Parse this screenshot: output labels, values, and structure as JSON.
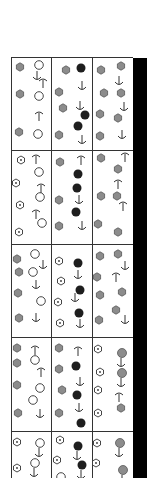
{
  "figure": {
    "grid": {
      "left": 11,
      "top": 57,
      "right": 133,
      "bottom": 478,
      "col_x": [
        51,
        92
      ],
      "row_y": [
        149,
        243,
        336,
        430
      ]
    },
    "colors": {
      "gray_fill": "#8c8c8c",
      "black_fill": "#1e1e1e",
      "stroke": "#333333",
      "bar": "#000000"
    },
    "legend_of_symbols": [
      "gray-hexagon",
      "white-circle",
      "black-circle",
      "dotted-hexagon",
      "anchor-up",
      "anchor-down",
      "anchor-diag"
    ],
    "symbols": [
      {
        "t": "hex",
        "x": 20,
        "y": 67
      },
      {
        "t": "circ",
        "x": 39,
        "y": 65
      },
      {
        "t": "dn",
        "x": 37,
        "y": 76
      },
      {
        "t": "up",
        "x": 43,
        "y": 83
      },
      {
        "t": "hex",
        "x": 20,
        "y": 94
      },
      {
        "t": "circ",
        "x": 39,
        "y": 96
      },
      {
        "t": "up",
        "x": 39,
        "y": 116
      },
      {
        "t": "hex",
        "x": 19,
        "y": 132
      },
      {
        "t": "circ",
        "x": 38,
        "y": 134
      },
      {
        "t": "hex",
        "x": 66,
        "y": 70
      },
      {
        "t": "blk",
        "x": 81,
        "y": 68
      },
      {
        "t": "dn",
        "x": 82,
        "y": 86
      },
      {
        "t": "hex",
        "x": 59,
        "y": 92
      },
      {
        "t": "dn",
        "x": 80,
        "y": 106
      },
      {
        "t": "hex",
        "x": 63,
        "y": 108
      },
      {
        "t": "blk",
        "x": 85,
        "y": 115
      },
      {
        "t": "blk",
        "x": 78,
        "y": 126
      },
      {
        "t": "hex",
        "x": 59,
        "y": 135
      },
      {
        "t": "dn",
        "x": 82,
        "y": 140
      },
      {
        "t": "hex",
        "x": 101,
        "y": 70
      },
      {
        "t": "hex",
        "x": 121,
        "y": 66
      },
      {
        "t": "dn",
        "x": 119,
        "y": 81
      },
      {
        "t": "hex",
        "x": 104,
        "y": 93
      },
      {
        "t": "hex",
        "x": 121,
        "y": 93
      },
      {
        "t": "dn",
        "x": 124,
        "y": 107
      },
      {
        "t": "hex",
        "x": 100,
        "y": 114
      },
      {
        "t": "hex",
        "x": 118,
        "y": 118
      },
      {
        "t": "dn",
        "x": 122,
        "y": 135
      },
      {
        "t": "hex",
        "x": 100,
        "y": 136
      },
      {
        "t": "dot",
        "x": 21,
        "y": 160
      },
      {
        "t": "up",
        "x": 36,
        "y": 159
      },
      {
        "t": "circ",
        "x": 39,
        "y": 172
      },
      {
        "t": "dot",
        "x": 16,
        "y": 183
      },
      {
        "t": "up",
        "x": 41,
        "y": 188
      },
      {
        "t": "circ",
        "x": 40,
        "y": 197
      },
      {
        "t": "dot",
        "x": 20,
        "y": 205
      },
      {
        "t": "up",
        "x": 36,
        "y": 214
      },
      {
        "t": "circ",
        "x": 42,
        "y": 223
      },
      {
        "t": "dot",
        "x": 19,
        "y": 232
      },
      {
        "t": "hex",
        "x": 60,
        "y": 162
      },
      {
        "t": "up",
        "x": 81,
        "y": 160
      },
      {
        "t": "blk",
        "x": 78,
        "y": 174
      },
      {
        "t": "blk",
        "x": 77,
        "y": 188
      },
      {
        "t": "hex",
        "x": 59,
        "y": 200
      },
      {
        "t": "dn",
        "x": 79,
        "y": 200
      },
      {
        "t": "blk",
        "x": 76,
        "y": 212
      },
      {
        "t": "hex",
        "x": 59,
        "y": 226
      },
      {
        "t": "dn",
        "x": 82,
        "y": 226
      },
      {
        "t": "hex",
        "x": 101,
        "y": 158
      },
      {
        "t": "up",
        "x": 125,
        "y": 157
      },
      {
        "t": "hex",
        "x": 118,
        "y": 169
      },
      {
        "t": "up",
        "x": 118,
        "y": 184
      },
      {
        "t": "hex",
        "x": 101,
        "y": 196
      },
      {
        "t": "hex",
        "x": 117,
        "y": 196
      },
      {
        "t": "up",
        "x": 123,
        "y": 206
      },
      {
        "t": "hex",
        "x": 98,
        "y": 224
      },
      {
        "t": "hex",
        "x": 118,
        "y": 232
      },
      {
        "t": "hex",
        "x": 17,
        "y": 259
      },
      {
        "t": "circ",
        "x": 35,
        "y": 254
      },
      {
        "t": "dn",
        "x": 43,
        "y": 265
      },
      {
        "t": "hex",
        "x": 19,
        "y": 272
      },
      {
        "t": "circ",
        "x": 33,
        "y": 272
      },
      {
        "t": "dn",
        "x": 36,
        "y": 285
      },
      {
        "t": "hex",
        "x": 18,
        "y": 293
      },
      {
        "t": "circ",
        "x": 41,
        "y": 301
      },
      {
        "t": "hex",
        "x": 19,
        "y": 318
      },
      {
        "t": "dn",
        "x": 36,
        "y": 318
      },
      {
        "t": "dot",
        "x": 59,
        "y": 261
      },
      {
        "t": "blk",
        "x": 78,
        "y": 263
      },
      {
        "t": "dn",
        "x": 78,
        "y": 275
      },
      {
        "t": "dot",
        "x": 61,
        "y": 281
      },
      {
        "t": "blk",
        "x": 80,
        "y": 290
      },
      {
        "t": "dn",
        "x": 75,
        "y": 298
      },
      {
        "t": "dot",
        "x": 58,
        "y": 302
      },
      {
        "t": "blk",
        "x": 79,
        "y": 313
      },
      {
        "t": "dn",
        "x": 80,
        "y": 324
      },
      {
        "t": "dot",
        "x": 60,
        "y": 323
      },
      {
        "t": "hex",
        "x": 100,
        "y": 256
      },
      {
        "t": "hex",
        "x": 118,
        "y": 254
      },
      {
        "t": "dn",
        "x": 125,
        "y": 266
      },
      {
        "t": "hex",
        "x": 97,
        "y": 277
      },
      {
        "t": "up",
        "x": 116,
        "y": 277
      },
      {
        "t": "hex",
        "x": 100,
        "y": 295
      },
      {
        "t": "hex",
        "x": 122,
        "y": 292
      },
      {
        "t": "hex",
        "x": 116,
        "y": 310
      },
      {
        "t": "dn",
        "x": 125,
        "y": 320
      },
      {
        "t": "hex",
        "x": 99,
        "y": 320
      },
      {
        "t": "hex",
        "x": 17,
        "y": 348
      },
      {
        "t": "up",
        "x": 35,
        "y": 350
      },
      {
        "t": "hex",
        "x": 17,
        "y": 363
      },
      {
        "t": "circ",
        "x": 35,
        "y": 360
      },
      {
        "t": "up",
        "x": 41,
        "y": 372
      },
      {
        "t": "hex",
        "x": 17,
        "y": 385
      },
      {
        "t": "circ",
        "x": 40,
        "y": 388
      },
      {
        "t": "circ",
        "x": 33,
        "y": 400
      },
      {
        "t": "hex",
        "x": 18,
        "y": 413
      },
      {
        "t": "dn",
        "x": 40,
        "y": 414
      },
      {
        "t": "hex",
        "x": 59,
        "y": 348
      },
      {
        "t": "up",
        "x": 78,
        "y": 351
      },
      {
        "t": "hex",
        "x": 59,
        "y": 369
      },
      {
        "t": "blk",
        "x": 76,
        "y": 366
      },
      {
        "t": "dn",
        "x": 80,
        "y": 382
      },
      {
        "t": "hex",
        "x": 62,
        "y": 390
      },
      {
        "t": "blk",
        "x": 77,
        "y": 395
      },
      {
        "t": "dn",
        "x": 79,
        "y": 408
      },
      {
        "t": "hex",
        "x": 59,
        "y": 413
      },
      {
        "t": "blk",
        "x": 81,
        "y": 423
      },
      {
        "t": "dot",
        "x": 98,
        "y": 349
      },
      {
        "t": "blk_gray_anchor",
        "x": 122,
        "y": 353
      },
      {
        "t": "dot",
        "x": 100,
        "y": 372
      },
      {
        "t": "blk_gray_anchor",
        "x": 122,
        "y": 373
      },
      {
        "t": "dot",
        "x": 98,
        "y": 390
      },
      {
        "t": "up",
        "x": 119,
        "y": 397
      },
      {
        "t": "hex",
        "x": 121,
        "y": 408
      },
      {
        "t": "dot",
        "x": 98,
        "y": 413
      },
      {
        "t": "dot",
        "x": 17,
        "y": 442
      },
      {
        "t": "circ_anchor",
        "x": 40,
        "y": 443
      },
      {
        "t": "dot",
        "x": 17,
        "y": 468
      },
      {
        "t": "circ_anchor",
        "x": 35,
        "y": 463
      },
      {
        "t": "dot",
        "x": 60,
        "y": 440
      },
      {
        "t": "blk_anchor",
        "x": 78,
        "y": 446
      },
      {
        "t": "dot",
        "x": 57,
        "y": 460
      },
      {
        "t": "blk_anchor",
        "x": 82,
        "y": 465
      },
      {
        "t": "circ",
        "x": 61,
        "y": 477
      },
      {
        "t": "dot",
        "x": 97,
        "y": 443
      },
      {
        "t": "gray_anchor",
        "x": 120,
        "y": 443
      },
      {
        "t": "dot",
        "x": 96,
        "y": 463
      },
      {
        "t": "gray_anchor",
        "x": 123,
        "y": 470
      }
    ]
  }
}
